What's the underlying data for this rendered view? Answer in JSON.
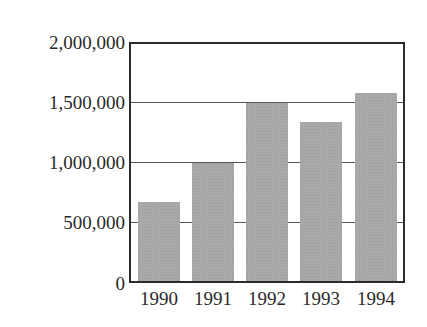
{
  "chart_data": {
    "type": "bar",
    "title": "",
    "xlabel": "",
    "ylabel": "",
    "categories": [
      "1990",
      "1991",
      "1992",
      "1993",
      "1994"
    ],
    "values": [
      670000,
      1000000,
      1500000,
      1340000,
      1590000
    ],
    "ylim": [
      0,
      2000000
    ],
    "yticks": [
      0,
      500000,
      1000000,
      1500000,
      2000000
    ],
    "ytick_labels": [
      "0",
      "500,000",
      "1,000,000",
      "1,500,000",
      "2,000,000"
    ],
    "grid": true,
    "legend": null,
    "bar_color": "#a9a9a9"
  }
}
